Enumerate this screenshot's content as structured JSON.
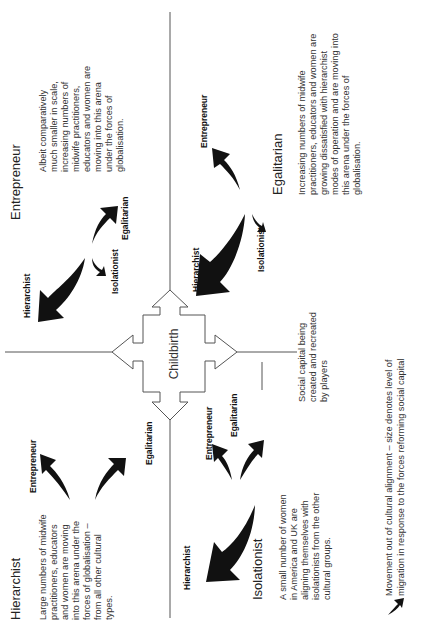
{
  "diagram": {
    "orientation": "rotated 90 degrees counter-clockwise",
    "center": {
      "label": "Childbirth"
    },
    "quadrants": {
      "entrepreneur": {
        "title": "Entrepreneur",
        "description_lines": [
          "Albeit comparatively",
          "much smaller in scale,",
          "increasing numbers of",
          "midwife practitioners,",
          "educators and women are",
          "moving into this arena",
          "under the forces of",
          "globalisation."
        ],
        "arrow_labels": [
          "Hierarchist",
          "Isolationist",
          "Egalitarian"
        ]
      },
      "egalitarian": {
        "title": "Egalitarian",
        "description_lines": [
          "Increasing numbers of midwife",
          "practitioners, educators and women are",
          "growing dissatisfied with hierarchist",
          "modes of operation and are moving into",
          "this arena under the forces of",
          "globalisation."
        ],
        "arrow_labels": [
          "Entrepreneur",
          "Hierarchist",
          "Isolationist"
        ]
      },
      "hierarchist": {
        "title": "Hierarchist",
        "description_lines": [
          "Large numbers of midwife",
          "practitioners, educators",
          "and women are moving",
          "into this arena under the",
          "forces of globalisation –",
          "from all other cultural",
          "types."
        ],
        "arrow_labels": [
          "Entrepreneur",
          "Egalitarian"
        ]
      },
      "isolationist": {
        "title": "Isolationist",
        "description_lines": [
          "A small number of women",
          "in America and UK are",
          "aligning themselves with",
          "isolationists from the other",
          "cultural groups."
        ],
        "arrow_labels": [
          "Hierarchist",
          "Entrepreneur",
          "Egalitarian"
        ]
      }
    },
    "annotation": {
      "lines": [
        "Social capital being",
        "created and recreated",
        "by players"
      ]
    },
    "legend": {
      "icon": "curved-arrow-icon",
      "lines": [
        "Movement out of cultural alignment – size denotes level of",
        "migration in response to the forces reforming social capital"
      ]
    }
  }
}
